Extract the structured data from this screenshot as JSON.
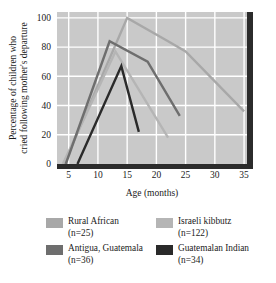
{
  "chart_data": {
    "type": "line",
    "title": "",
    "xlabel": "Age (months)",
    "ylabel": "Percentage of children who cried following mother's departure",
    "ylabel_line1": "Percentage of children who",
    "ylabel_line2": "cried following mother's departure",
    "xlim": [
      3,
      35.5
    ],
    "ylim": [
      0,
      104
    ],
    "xticks": [
      5,
      10,
      15,
      20,
      25,
      30,
      35
    ],
    "yticks": [
      0,
      20,
      40,
      60,
      80,
      100
    ],
    "xtick_labels": [
      "5",
      "10",
      "15",
      "20",
      "25",
      "30",
      "35"
    ],
    "ytick_labels": [
      "0",
      "20",
      "40",
      "60",
      "80",
      "100"
    ],
    "grid": true,
    "grid_color": "#ffffff",
    "plot_background": "#c9c9c9",
    "legend_position": "below",
    "series": [
      {
        "name": "Rural African",
        "n_label": "(n=25)",
        "color": "#a8a8a8",
        "points": [
          [
            4.2,
            0
          ],
          [
            15.0,
            100
          ],
          [
            22.0,
            84
          ],
          [
            25.0,
            77
          ],
          [
            35.0,
            36
          ]
        ]
      },
      {
        "name": "Israeli kibbutz",
        "n_label": "(n=122)",
        "color": "#b5b5b5",
        "points": [
          [
            4.0,
            0
          ],
          [
            13.0,
            77
          ],
          [
            22.0,
            18
          ]
        ]
      },
      {
        "name": "Antigua, Guatemala",
        "n_label": "(n=36)",
        "color": "#6e6e6e",
        "points": [
          [
            4.5,
            0
          ],
          [
            12.0,
            84
          ],
          [
            18.5,
            70
          ],
          [
            24.0,
            33
          ]
        ]
      },
      {
        "name": "Guatemalan Indian",
        "n_label": "(n=34)",
        "color": "#2a2a2a",
        "points": [
          [
            6.5,
            0
          ],
          [
            14.0,
            67
          ],
          [
            17.0,
            22
          ]
        ]
      }
    ]
  },
  "legend": {
    "entries": [
      {
        "label": "Rural African",
        "n": "(n=25)",
        "color": "#a8a8a8"
      },
      {
        "label": "Israeli kibbutz",
        "n": "(n=122)",
        "color": "#b5b5b5"
      },
      {
        "label": "Antigua, Guatemala",
        "n": "(n=36)",
        "color": "#6e6e6e"
      },
      {
        "label": "Guatemalan Indian",
        "n": "(n=34)",
        "color": "#2a2a2a"
      }
    ]
  }
}
